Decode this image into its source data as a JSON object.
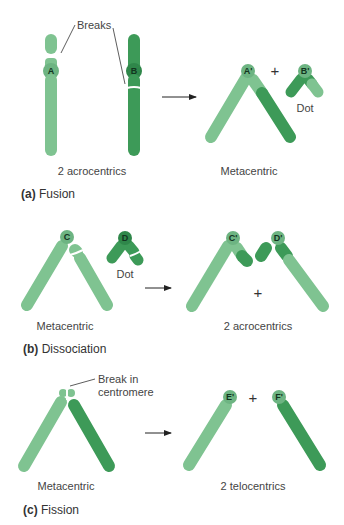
{
  "colors": {
    "light_green": "#7fc391",
    "dark_green": "#3d9a58",
    "centromere_light": "#6db482",
    "centromere_dark": "#2f874a",
    "text": "#333333"
  },
  "panels": [
    {
      "caption_letter": "(a)",
      "caption_text": "Fusion",
      "before": {
        "label": "2 acrocentrics",
        "annotation": "Breaks",
        "chromosomes": [
          {
            "centromere": "A",
            "color": "light"
          },
          {
            "centromere": "B",
            "color": "dark"
          }
        ]
      },
      "after": {
        "label": "Metacentric",
        "centromere": "A'",
        "plus": "+",
        "dot": {
          "centromere": "B'",
          "label": "Dot"
        }
      }
    },
    {
      "caption_letter": "(b)",
      "caption_text": "Dissociation",
      "before": {
        "label": "Metacentric",
        "centromere": "C",
        "dot": {
          "centromere": "D",
          "label": "Dot"
        }
      },
      "after": {
        "label": "2 acrocentrics",
        "plus": "+",
        "chromosomes": [
          {
            "centromere": "C'"
          },
          {
            "centromere": "D'"
          }
        ]
      }
    },
    {
      "caption_letter": "(c)",
      "caption_text": "Fission",
      "before": {
        "label": "Metacentric",
        "annotation_line1": "Break in",
        "annotation_line2": "centromere"
      },
      "after": {
        "label": "2 telocentrics",
        "plus": "+",
        "chromosomes": [
          {
            "centromere": "E'"
          },
          {
            "centromere": "F'"
          }
        ]
      }
    }
  ]
}
